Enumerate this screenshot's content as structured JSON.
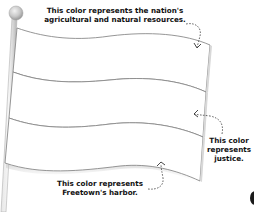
{
  "figure": {
    "bands": [
      {
        "position": "top",
        "fill": "#ffffff"
      },
      {
        "position": "middle",
        "fill": "#ffffff"
      },
      {
        "position": "bottom",
        "fill": "#ffffff"
      }
    ],
    "colors": {
      "outline": "#8a8a8a",
      "pole": "#c8c8c8",
      "pole_finial": "#bdbdbd",
      "text": "#111111",
      "arrow": "#444444"
    }
  },
  "annotations": {
    "top": {
      "line1": "This color represents the nation's",
      "line2": "agricultural and natural resources."
    },
    "right": {
      "line1": "This color",
      "line2": "represents",
      "line3": "justice."
    },
    "bottom": {
      "line1": "This color represents",
      "line2": "Freetown's harbor."
    }
  }
}
